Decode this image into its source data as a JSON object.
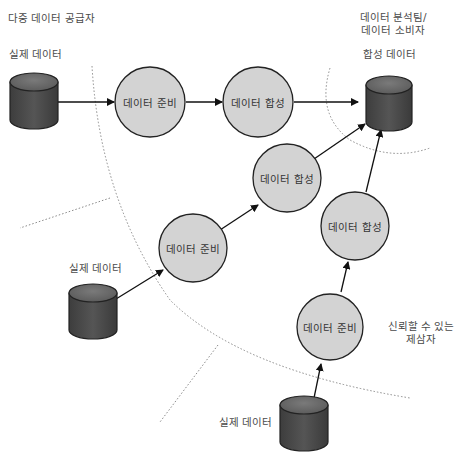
{
  "regions": {
    "multi_provider": "다중 데이터 공급자",
    "analyst": [
      "데이터 분석팀/",
      "데이터 소비자"
    ],
    "trusted_third_party": [
      "신뢰할 수 있는",
      "제삼자"
    ]
  },
  "sources": [
    {
      "label": "실제 데이터"
    },
    {
      "label": "실제 데이터"
    },
    {
      "label": "실제 데이터"
    }
  ],
  "target": {
    "label": "합성 데이터"
  },
  "nodes": [
    {
      "label": "데이터 준비"
    },
    {
      "label": "데이터 합성"
    },
    {
      "label": "데이터 준비"
    },
    {
      "label": "데이터 합성"
    },
    {
      "label": "데이터 준비"
    },
    {
      "label": "데이터 합성"
    }
  ],
  "colors": {
    "node_fill": "#d3d3d3",
    "node_stroke": "#222222",
    "cylinder_body": "#4a4a4a",
    "cylinder_top": "#6b6b6b",
    "arrow": "#111111",
    "boundary": "#888888"
  }
}
